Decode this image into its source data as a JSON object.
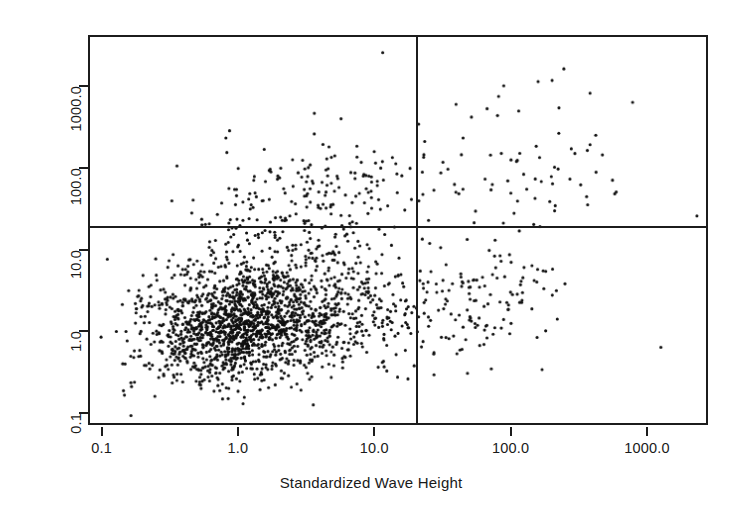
{
  "figure": {
    "background": "#ffffff",
    "foreground": "#1c1c1c",
    "point_color": "#111111"
  },
  "chart_data": {
    "type": "scatter",
    "title": "",
    "xlabel": "Standardized Wave Height",
    "ylabel": "Standardized Surge",
    "xscale": "log",
    "yscale": "log",
    "xlim": [
      0.0795,
      2800
    ],
    "ylim": [
      0.072,
      4200
    ],
    "grid": false,
    "legend": null,
    "xticks": [
      0.1,
      1.0,
      10.0,
      100.0,
      1000.0
    ],
    "xticklabels": [
      "0.1",
      "1.0",
      "10.0",
      "100.0",
      "1000.0"
    ],
    "yticks": [
      0.1,
      1.0,
      10.0,
      100.0,
      1000.0
    ],
    "yticklabels": [
      "0.1",
      "1.0",
      "10.0",
      "100.0",
      "1000.0"
    ],
    "point_marker": "filled-circle",
    "point_size_px": 3.1,
    "n_points_approx": 2350,
    "annotations": [
      {
        "name": "wave-height-threshold",
        "type": "vline",
        "x": 20.0,
        "label": ""
      },
      {
        "name": "surge-threshold",
        "type": "hline",
        "y": 20.0,
        "label": ""
      }
    ],
    "quadrants": {
      "lower_left": {
        "label": "both below threshold",
        "density": "very-high",
        "n_approx": 1960
      },
      "upper_left": {
        "label": "surge above, wave below",
        "density": "low",
        "n_approx": 175
      },
      "lower_right": {
        "label": "wave above, surge below",
        "density": "low",
        "n_approx": 140
      },
      "upper_right": {
        "label": "both above threshold",
        "density": "very-low",
        "n_approx": 75
      }
    },
    "clusters": [
      {
        "name": "main-bulk",
        "center_x": 1.2,
        "center_y": 1.3,
        "spread_log10_x": 0.42,
        "spread_log10_y": 0.38,
        "n": 1900
      },
      {
        "name": "upper-left-tail",
        "center_x": 3.0,
        "center_y": 45.0,
        "spread_log10_x": 0.45,
        "spread_log10_y": 0.34,
        "n": 175
      },
      {
        "name": "lower-right-tail",
        "center_x": 45.0,
        "center_y": 2.2,
        "spread_log10_x": 0.35,
        "spread_log10_y": 0.4,
        "n": 140
      },
      {
        "name": "upper-right-sparse",
        "center_x": 110.0,
        "center_y": 90.0,
        "spread_log10_x": 0.48,
        "spread_log10_y": 0.45,
        "n": 72
      }
    ],
    "outliers": [
      {
        "x": 11.5,
        "y": 2700
      },
      {
        "x": 250.0,
        "y": 1700
      },
      {
        "x": 90.0,
        "y": 1050
      },
      {
        "x": 390.0,
        "y": 850
      },
      {
        "x": 3.6,
        "y": 480
      },
      {
        "x": 40.0,
        "y": 620
      },
      {
        "x": 230.0,
        "y": 560
      },
      {
        "x": 2400.0,
        "y": 26.0
      },
      {
        "x": 1300.0,
        "y": 0.62
      }
    ]
  },
  "axes": {
    "x": {
      "title": "Standardized Wave Height",
      "ticks": [
        {
          "value": 0.1,
          "label": "0.1"
        },
        {
          "value": 1.0,
          "label": "1.0"
        },
        {
          "value": 10.0,
          "label": "10.0"
        },
        {
          "value": 100.0,
          "label": "100.0"
        },
        {
          "value": 1000.0,
          "label": "1000.0"
        }
      ]
    },
    "y": {
      "title": "Standardized Surge",
      "ticks": [
        {
          "value": 0.1,
          "label": "0.1"
        },
        {
          "value": 1.0,
          "label": "1.0"
        },
        {
          "value": 10.0,
          "label": "10.0"
        },
        {
          "value": 100.0,
          "label": "100.0"
        },
        {
          "value": 1000.0,
          "label": "1000.0"
        }
      ]
    }
  }
}
